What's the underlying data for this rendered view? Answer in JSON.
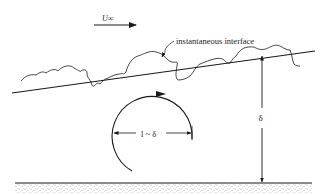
{
  "diagram": {
    "labels": {
      "freestream_velocity": "U∞",
      "interface": "instantaneous interface",
      "thickness": "δ",
      "eddy_scale": "l ~ δ"
    },
    "elements": [
      {
        "id": "freestream-arrow",
        "type": "arrow",
        "direction": "right",
        "label": "U∞"
      },
      {
        "id": "mean-edge-line",
        "type": "line",
        "description": "mean boundary-layer edge, rising downstream"
      },
      {
        "id": "instantaneous-interface",
        "type": "wavy-curve",
        "label": "instantaneous interface"
      },
      {
        "id": "large-eddy",
        "type": "circular-arrow",
        "rotation": "clockwise",
        "label": "l ~ δ"
      },
      {
        "id": "thickness-dimension",
        "type": "double-arrow",
        "orientation": "vertical",
        "label": "δ"
      },
      {
        "id": "wall",
        "type": "hatched-surface"
      }
    ],
    "colors": {
      "ink": "#1a1a1a",
      "background": "#ffffff",
      "wall_hatch": "#9a9a9a"
    }
  }
}
